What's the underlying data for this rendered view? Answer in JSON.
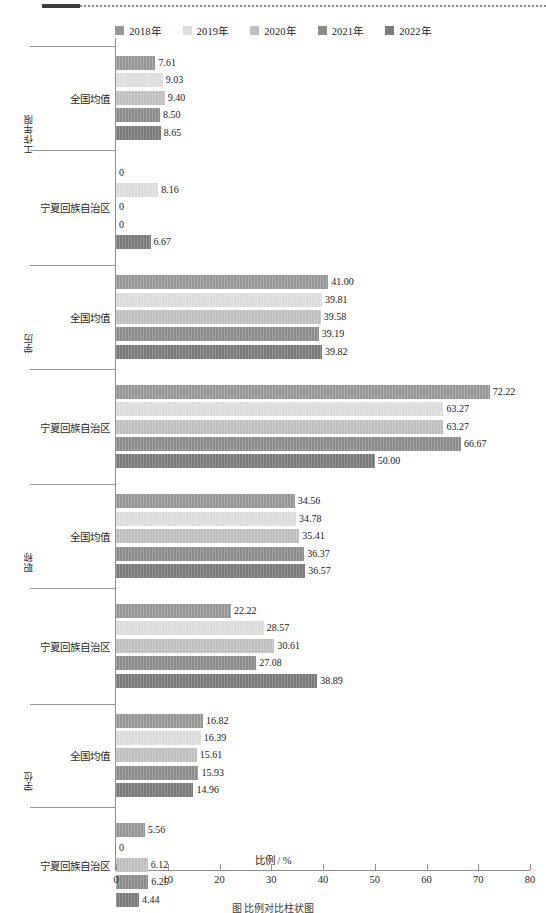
{
  "legend": {
    "items": [
      {
        "label": "2018年",
        "color": "#969696"
      },
      {
        "label": "2019年",
        "color": "#dcdcdc"
      },
      {
        "label": "2020年",
        "color": "#bfbfbf"
      },
      {
        "label": "2021年",
        "color": "#8c8c8c"
      },
      {
        "label": "2022年",
        "color": "#7a7a7a"
      }
    ]
  },
  "axis": {
    "x_title": "比例 / %",
    "ticks": [
      "0",
      "10",
      "20",
      "30",
      "40",
      "50",
      "60",
      "70",
      "80"
    ]
  },
  "caption": "图 比例对比柱状图",
  "chart_data": {
    "type": "bar",
    "orientation": "horizontal",
    "title": "",
    "xlabel": "比例 / %",
    "ylabel": "",
    "xlim": [
      0,
      80
    ],
    "grid": false,
    "legend_position": "top-center",
    "series": [
      {
        "name": "2018年",
        "color": "#969696"
      },
      {
        "name": "2019年",
        "color": "#dcdcdc"
      },
      {
        "name": "2020年",
        "color": "#bfbfbf"
      },
      {
        "name": "2021年",
        "color": "#8c8c8c"
      },
      {
        "name": "2022年",
        "color": "#7a7a7a"
      }
    ],
    "groups": [
      {
        "group_label": "工作年限",
        "categories": [
          {
            "name": "全国均值",
            "values": [
              7.61,
              9.03,
              9.4,
              8.5,
              8.65
            ],
            "labels": [
              "7.61",
              "9.03",
              "9.40",
              "8.50",
              "8.65"
            ]
          },
          {
            "name": "宁夏回族自治区",
            "values": [
              0,
              8.16,
              0,
              0,
              6.67
            ],
            "labels": [
              "0",
              "8.16",
              "0",
              "0",
              "6.67"
            ]
          }
        ]
      },
      {
        "group_label": "学历",
        "categories": [
          {
            "name": "全国均值",
            "values": [
              41.0,
              39.81,
              39.58,
              39.19,
              39.82
            ],
            "labels": [
              "41.00",
              "39.81",
              "39.58",
              "39.19",
              "39.82"
            ]
          },
          {
            "name": "宁夏回族自治区",
            "values": [
              72.22,
              63.27,
              63.27,
              66.67,
              50.0
            ],
            "labels": [
              "72.22",
              "63.27",
              "63.27",
              "66.67",
              "50.00"
            ]
          }
        ]
      },
      {
        "group_label": "职称",
        "categories": [
          {
            "name": "全国均值",
            "values": [
              34.56,
              34.78,
              35.41,
              36.37,
              36.57
            ],
            "labels": [
              "34.56",
              "34.78",
              "35.41",
              "36.37",
              "36.57"
            ]
          },
          {
            "name": "宁夏回族自治区",
            "values": [
              22.22,
              28.57,
              30.61,
              27.08,
              38.89
            ],
            "labels": [
              "22.22",
              "28.57",
              "30.61",
              "27.08",
              "38.89"
            ]
          }
        ]
      },
      {
        "group_label": "学位",
        "categories": [
          {
            "name": "全国均值",
            "values": [
              16.82,
              16.39,
              15.61,
              15.93,
              14.96
            ],
            "labels": [
              "16.82",
              "16.39",
              "15.61",
              "15.93",
              "14.96"
            ]
          },
          {
            "name": "宁夏回族自治区",
            "values": [
              5.56,
              0,
              6.12,
              6.25,
              4.44
            ],
            "labels": [
              "5.56",
              "0",
              "6.12",
              "6.25",
              "4.44"
            ]
          }
        ]
      }
    ]
  }
}
